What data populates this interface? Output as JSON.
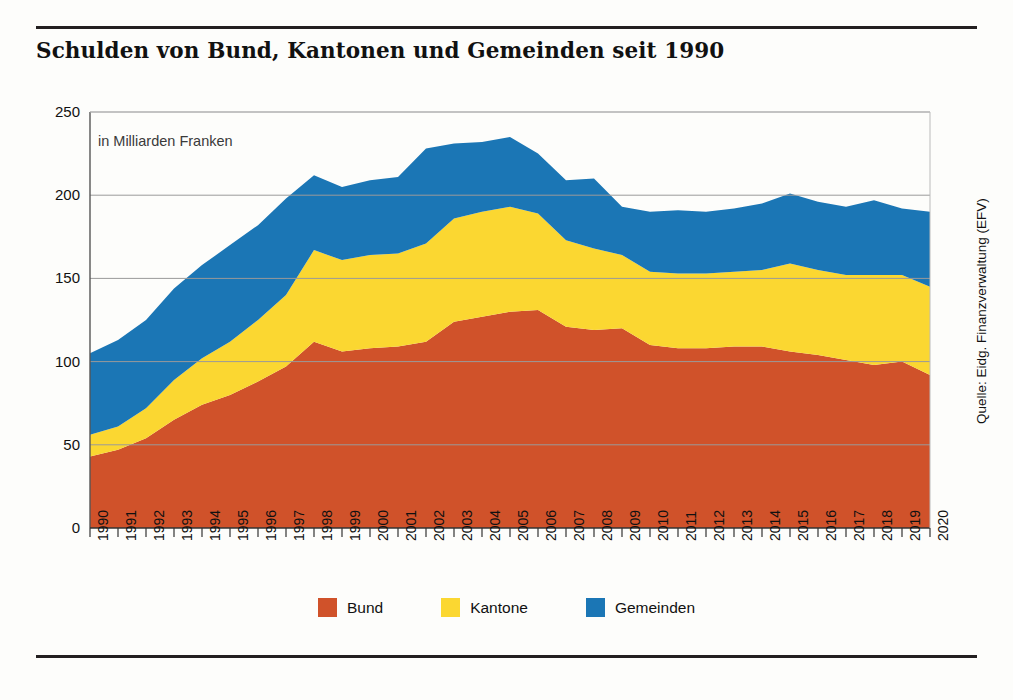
{
  "title": "Schulden von Bund, Kantonen und Gemeinden seit 1990",
  "source": "Quelle: Eidg. Finanzverwaltung (EFV)",
  "legend": [
    {
      "label": "Bund",
      "color": "#D0522A"
    },
    {
      "label": "Kantone",
      "color": "#FBD731"
    },
    {
      "label": "Gemeinden",
      "color": "#1B76B5"
    }
  ],
  "chart_data": {
    "type": "area",
    "stacked": true,
    "title": "Schulden von Bund, Kantonen und Gemeinden seit 1990",
    "subtitle": "in Milliarden Franken",
    "xlabel": "",
    "ylabel": "in Milliarden Franken",
    "ylim": [
      0,
      250
    ],
    "yticks": [
      0,
      50,
      100,
      150,
      200,
      250
    ],
    "grid": true,
    "legend_position": "bottom",
    "categories": [
      "1990",
      "1991",
      "1992",
      "1993",
      "1994",
      "1995",
      "1996",
      "1997",
      "1998",
      "1999",
      "2000",
      "2001",
      "2002",
      "2003",
      "2004",
      "2005",
      "2006",
      "2007",
      "2008",
      "2009",
      "2010",
      "2011",
      "2012",
      "2013",
      "2014",
      "2015",
      "2016",
      "2017",
      "2018",
      "2019",
      "2020"
    ],
    "series": [
      {
        "name": "Bund",
        "color": "#D0522A",
        "values": [
          43,
          47,
          54,
          65,
          74,
          80,
          88,
          97,
          112,
          106,
          108,
          109,
          112,
          124,
          127,
          130,
          131,
          121,
          119,
          120,
          110,
          108,
          108,
          109,
          109,
          106,
          104,
          101,
          98,
          100,
          92
        ]
      },
      {
        "name": "Kantone",
        "color": "#FBD731",
        "values": [
          13,
          14,
          18,
          24,
          28,
          32,
          37,
          43,
          55,
          55,
          56,
          56,
          59,
          62,
          63,
          63,
          58,
          52,
          49,
          44,
          44,
          45,
          45,
          45,
          46,
          53,
          51,
          51,
          54,
          52,
          53
        ]
      },
      {
        "name": "Gemeinden",
        "color": "#1B76B5",
        "values": [
          49,
          52,
          53,
          55,
          56,
          58,
          57,
          58,
          45,
          44,
          45,
          46,
          57,
          45,
          42,
          42,
          36,
          36,
          42,
          29,
          36,
          38,
          37,
          38,
          40,
          42,
          41,
          41,
          45,
          40,
          45
        ]
      }
    ],
    "totals": [
      105,
      113,
      125,
      144,
      158,
      170,
      182,
      198,
      212,
      205,
      209,
      211,
      228,
      231,
      232,
      235,
      225,
      209,
      210,
      193,
      190,
      191,
      190,
      192,
      195,
      201,
      196,
      193,
      197,
      192,
      190
    ]
  }
}
